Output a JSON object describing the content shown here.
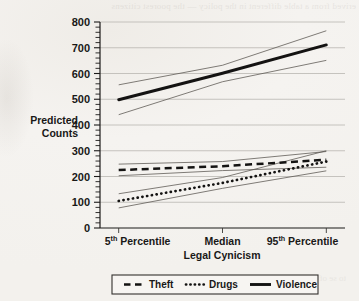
{
  "page": {
    "bleed_top_text": "erived from a table different in the policy — the poorest citizens",
    "bleed_bottom_text": "to se of the second section"
  },
  "chart_data": {
    "type": "line",
    "title": "",
    "xlabel": "Legal Cynicism",
    "ylabel": "Predicted Counts",
    "ylabel_lines": [
      "Predicted",
      "Counts"
    ],
    "categories": [
      "5th Percentile",
      "Median",
      "95th Percentile"
    ],
    "x": [
      0,
      1,
      2
    ],
    "ylim": [
      0,
      800
    ],
    "xlim": [
      -0.18,
      2.18
    ],
    "ytick_values": [
      0,
      100,
      200,
      300,
      400,
      500,
      600,
      700,
      800
    ],
    "ytick_labels": [
      "0",
      "100",
      "200",
      "300",
      "400",
      "500",
      "600",
      "700",
      "800"
    ],
    "ytick_minor_step": 20,
    "grid": "horizontal-major",
    "legend_position": "below-center",
    "series": [
      {
        "name": "Theft",
        "style": "dashed",
        "values": [
          225,
          240,
          265
        ],
        "ci_upper": [
          248,
          258,
          297
        ],
        "ci_lower": [
          203,
          223,
          236
        ]
      },
      {
        "name": "Drugs",
        "style": "dotted",
        "values": [
          105,
          175,
          258
        ],
        "ci_upper": [
          133,
          196,
          300
        ],
        "ci_lower": [
          78,
          154,
          222
        ]
      },
      {
        "name": "Violence",
        "style": "solid",
        "values": [
          498,
          601,
          711
        ],
        "ci_upper": [
          556,
          632,
          766
        ],
        "ci_lower": [
          440,
          568,
          651
        ]
      }
    ]
  },
  "axis": {
    "y_title_line1": "Predicted",
    "y_title_line2": "Counts",
    "x_title": "Legal Cynicism",
    "xtick_0_value": "5",
    "xtick_0_sup": "th",
    "xtick_0_rest": " Percentile",
    "xtick_1_label": "Median",
    "xtick_2_value": "95",
    "xtick_2_sup": "th",
    "xtick_2_rest": " Percentile"
  },
  "legend": {
    "items": [
      {
        "label": "Theft",
        "style": "dashed"
      },
      {
        "label": "Drugs",
        "style": "dotted"
      },
      {
        "label": "Violence",
        "style": "solid"
      }
    ]
  },
  "colors": {
    "ink": "#141312",
    "grid": "#b9b6b1",
    "ci": "#57534d",
    "paper": "#f4f2ef"
  }
}
